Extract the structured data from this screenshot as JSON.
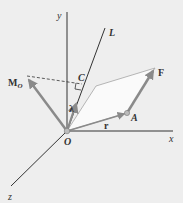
{
  "diagram": {
    "type": "3d-vector-moment-about-axis",
    "labels": {
      "y_axis": "y",
      "x_axis": "x",
      "z_axis": "z",
      "axis_L": "L",
      "moment": "M",
      "moment_sub": "O",
      "point_C": "C",
      "unit_vector": "λ",
      "force": "F",
      "position": "r",
      "point_A": "A",
      "origin": "O"
    },
    "colors": {
      "background": "#eeeeee",
      "axes": "#333333",
      "vectors": "#8a8a8a",
      "plane_fill": "#f8f8f8",
      "plane_edge": "#999999"
    }
  }
}
